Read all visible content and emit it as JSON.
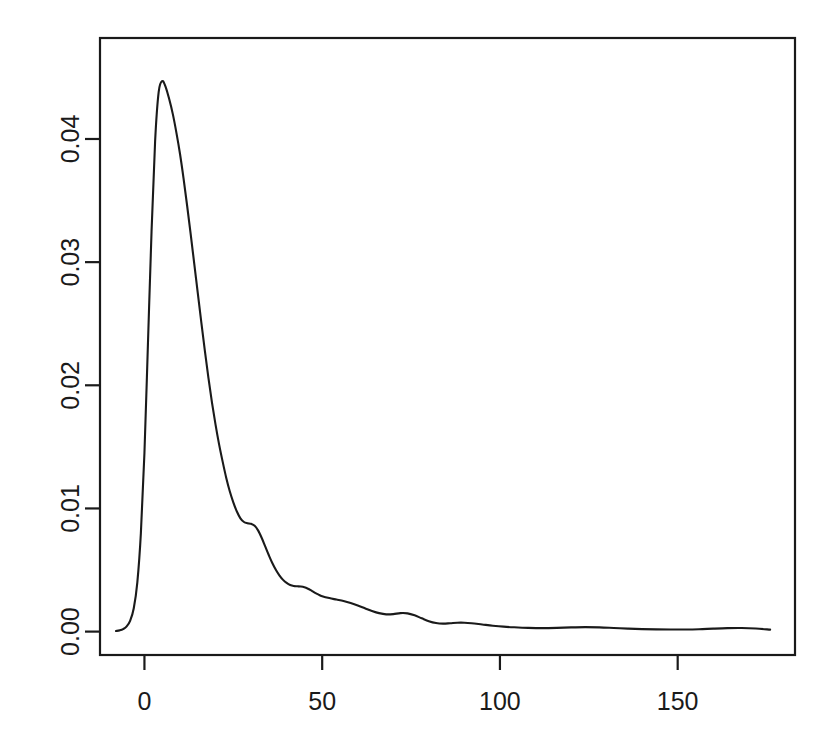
{
  "figure": {
    "background_color": "#ffffff",
    "line_color": "#1a1a1a",
    "axis_color": "#1a1a1a",
    "plot_box": {
      "left": 100,
      "top": 38,
      "right": 795,
      "bottom": 655
    }
  },
  "chart_data": {
    "type": "line",
    "title": "",
    "subtitle": "",
    "xlabel": "",
    "ylabel": "",
    "grid": false,
    "legend": null,
    "annotations": [],
    "xlim": [
      -12.5,
      183
    ],
    "ylim": [
      -0.0019,
      0.0482
    ],
    "xticks": [
      0,
      50,
      100,
      150
    ],
    "xtick_labels": [
      "0",
      "50",
      "100",
      "150"
    ],
    "yticks": [
      0.0,
      0.01,
      0.02,
      0.03,
      0.04
    ],
    "ytick_labels": [
      "0.00",
      "0.01",
      "0.02",
      "0.03",
      "0.04"
    ],
    "ytick_rotation": 90,
    "series": [
      {
        "name": "density",
        "x": [
          -8.0,
          -7.0,
          -6.0,
          -5.0,
          -4.0,
          -3.0,
          -2.0,
          -1.0,
          0.0,
          1.0,
          2.0,
          3.0,
          4.0,
          5.0,
          6.0,
          7.0,
          8.0,
          9.0,
          10.0,
          11.0,
          12.0,
          13.0,
          14.0,
          15.0,
          16.0,
          17.0,
          18.0,
          19.0,
          20.0,
          21.0,
          22.0,
          23.0,
          24.0,
          25.0,
          26.0,
          27.0,
          28.0,
          29.0,
          30.0,
          31.0,
          32.0,
          33.0,
          34.0,
          35.0,
          36.0,
          37.0,
          38.0,
          39.0,
          40.0,
          41.0,
          42.0,
          43.0,
          44.0,
          45.0,
          46.0,
          47.0,
          48.0,
          49.0,
          50.0,
          52.0,
          54.0,
          56.0,
          58.0,
          60.0,
          62.0,
          64.0,
          66.0,
          68.0,
          70.0,
          72.0,
          74.0,
          76.0,
          78.0,
          80.0,
          82.0,
          84.0,
          86.0,
          88.0,
          90.0,
          92.0,
          95.0,
          98.0,
          101.0,
          104.0,
          108.0,
          112.0,
          116.0,
          120.0,
          124.0,
          128.0,
          132.0,
          136.0,
          140.0,
          144.0,
          148.0,
          152.0,
          156.0,
          160.0,
          164.0,
          168.0,
          172.0,
          176.0
        ],
        "y": [
          5e-05,
          0.0001,
          0.0002,
          0.00042,
          0.0009,
          0.0019,
          0.004,
          0.008,
          0.0145,
          0.0235,
          0.0325,
          0.0398,
          0.0438,
          0.0447,
          0.0442,
          0.0432,
          0.042,
          0.0405,
          0.0388,
          0.0368,
          0.0346,
          0.0323,
          0.0299,
          0.0275,
          0.0251,
          0.0228,
          0.0206,
          0.0186,
          0.0168,
          0.0152,
          0.0138,
          0.0125,
          0.0114,
          0.0105,
          0.00975,
          0.0092,
          0.0089,
          0.0088,
          0.00875,
          0.0086,
          0.0082,
          0.0076,
          0.0069,
          0.0062,
          0.00555,
          0.005,
          0.00455,
          0.0042,
          0.00395,
          0.00378,
          0.0037,
          0.00368,
          0.00366,
          0.0036,
          0.00348,
          0.00332,
          0.00315,
          0.003,
          0.00288,
          0.00272,
          0.0026,
          0.00248,
          0.00232,
          0.00212,
          0.0019,
          0.00168,
          0.0015,
          0.0014,
          0.00142,
          0.0015,
          0.00148,
          0.00132,
          0.00108,
          0.00085,
          0.0007,
          0.00065,
          0.00068,
          0.00072,
          0.00072,
          0.00068,
          0.00058,
          0.00048,
          0.0004,
          0.00035,
          0.0003,
          0.00028,
          0.0003,
          0.00034,
          0.00036,
          0.00034,
          0.00029,
          0.00024,
          0.0002,
          0.00018,
          0.00017,
          0.00017,
          0.00019,
          0.00024,
          0.00028,
          0.00029,
          0.00025,
          0.00016
        ]
      }
    ],
    "peak": {
      "x": 5.0,
      "y": 0.0447
    }
  }
}
